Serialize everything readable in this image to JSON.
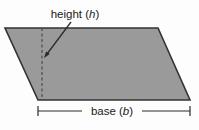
{
  "figure": {
    "name": "parallelogram-area-diagram",
    "background_color": "#fdfdfd"
  },
  "shape": {
    "name": "parallelogram",
    "fill_color": "#9a9a9a",
    "stroke_color": "#333333",
    "stroke_width": 1.6,
    "vertices": [
      {
        "x": 5,
        "y": 28
      },
      {
        "x": 158,
        "y": 28
      },
      {
        "x": 190,
        "y": 100
      },
      {
        "x": 38,
        "y": 100
      }
    ]
  },
  "height_marker": {
    "name": "height-dashed-line",
    "stroke_color": "#3a3a3a",
    "dash_pattern": "3 2.5",
    "x": 42,
    "y_top": 28,
    "y_bottom": 100
  },
  "leader": {
    "name": "height-leader-line",
    "stroke_color": "#2a2a2a",
    "from": {
      "x": 71,
      "y": 22
    },
    "to": {
      "x": 44,
      "y": 58
    }
  },
  "base_dimension": {
    "name": "base-dimension-line",
    "stroke_color": "#2a2a2a",
    "y": 111,
    "x_start": 38,
    "x_end": 190,
    "tick_half_height": 5,
    "gap_start": 82,
    "gap_end": 142
  },
  "labels": {
    "height": {
      "prefix": "height (",
      "variable": "h",
      "suffix": ")",
      "x": 75,
      "y": 18,
      "anchor": "middle"
    },
    "base": {
      "prefix": "base (",
      "variable": "b",
      "suffix": ")",
      "x": 112,
      "y": 115,
      "anchor": "middle"
    }
  }
}
